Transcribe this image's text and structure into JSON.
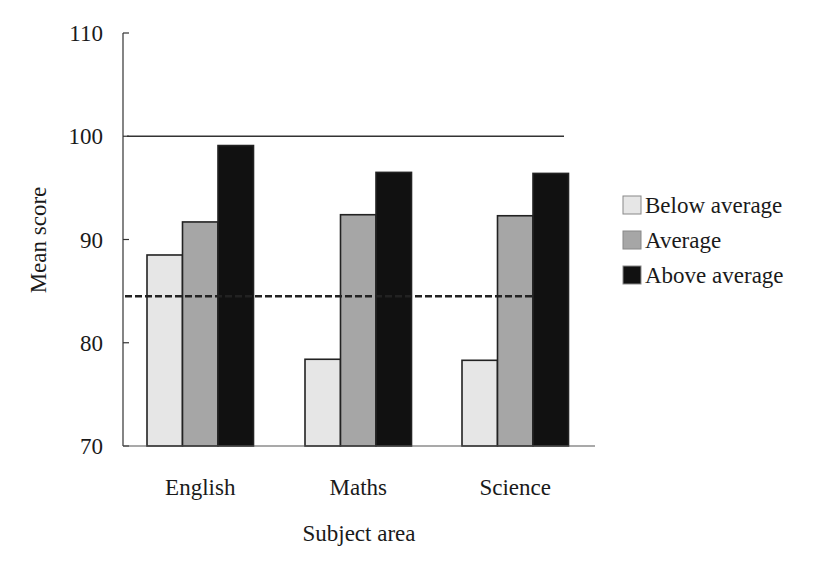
{
  "chart_data": {
    "type": "bar",
    "title": "",
    "xlabel": "Subject area",
    "ylabel": "Mean score",
    "categories": [
      "English",
      "Maths",
      "Science"
    ],
    "series": [
      {
        "name": "Below average",
        "values": [
          88.5,
          78.4,
          78.3
        ],
        "color": "#e6e6e6"
      },
      {
        "name": "Average",
        "values": [
          91.7,
          92.4,
          92.3
        ],
        "color": "#a6a6a6"
      },
      {
        "name": "Above average",
        "values": [
          99.1,
          96.5,
          96.4
        ],
        "color": "#111111"
      }
    ],
    "ylim": [
      70,
      110
    ],
    "yticks": [
      70,
      80,
      90,
      100,
      110
    ],
    "ytick_labels": [
      "70",
      "80",
      "90",
      "100",
      "110"
    ],
    "reference_lines": [
      {
        "name": "standardised-mean",
        "value": 100,
        "style": "solid"
      },
      {
        "name": "group-mean",
        "value": 84.5,
        "style": "dashed"
      }
    ],
    "grid": false,
    "legend_position": "right"
  }
}
